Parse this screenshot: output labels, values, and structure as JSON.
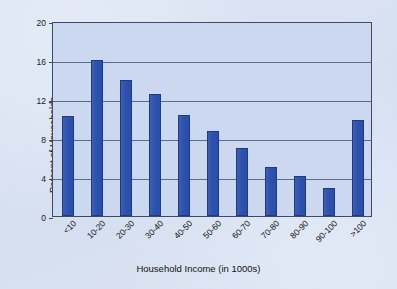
{
  "chart_data": {
    "type": "bar",
    "title": "",
    "xlabel": "Household Income (in 1000s)",
    "ylabel": "Percent of Households",
    "categories": [
      "<10",
      "10-20",
      "20-30",
      "30-40",
      "40-50",
      "50-60",
      "60-70",
      "70-80",
      "80-90",
      "90-100",
      ">100"
    ],
    "values": [
      10.3,
      16.0,
      14.0,
      12.5,
      10.4,
      8.7,
      7.0,
      5.0,
      4.1,
      2.9,
      9.8
    ],
    "ylim": [
      0,
      20
    ],
    "yticks": [
      0,
      4,
      8,
      12,
      16,
      20
    ],
    "ytick_labels": [
      "0",
      "4",
      "8",
      "12",
      "16",
      "20"
    ],
    "grid": true,
    "legend": "none",
    "bar_color": "#2f52ad",
    "bar_edge_color": "#1f3b86",
    "plot_background": "#ccd8ef",
    "page_background": "#d9e2f2",
    "axis_color": "#3c4a66"
  }
}
